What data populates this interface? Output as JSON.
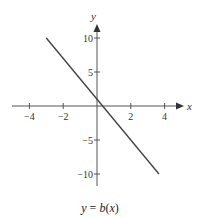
{
  "chart_data": {
    "type": "line",
    "title": "",
    "caption": "y = b(x)",
    "xlabel": "x",
    "ylabel": "y",
    "xlim": [
      -4.5,
      4.5
    ],
    "ylim": [
      -12,
      12
    ],
    "x_ticks": [
      -4,
      -2,
      2,
      4
    ],
    "x_tick_labels": [
      "−4",
      "−2",
      "2",
      "4"
    ],
    "y_ticks": [
      10,
      5,
      -5,
      -10
    ],
    "y_tick_labels": [
      "10",
      "5",
      "−5",
      "−10"
    ],
    "grid": false,
    "series": [
      {
        "name": "b(x)",
        "equation": "y = -3x + 1",
        "x": [
          -3,
          3.667
        ],
        "y": [
          10,
          -10
        ],
        "color": "#444444"
      }
    ]
  }
}
